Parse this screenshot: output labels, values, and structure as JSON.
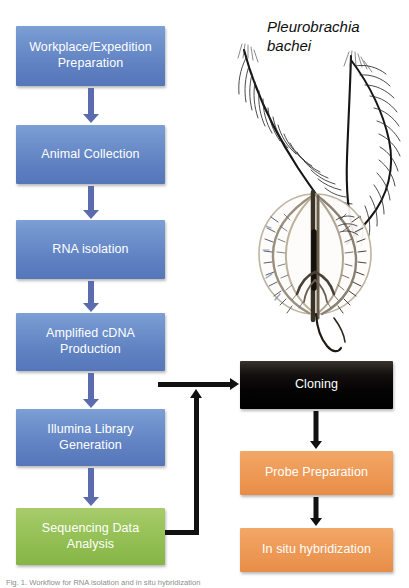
{
  "figure": {
    "species_label": "Pleurobrachia\nbachei",
    "caption": "Fig. 1. Workflow for RNA isolation and in situ hybridization",
    "organism_icon": "ctenophore-illustration"
  },
  "colors": {
    "blue_box": "#6a8bc7",
    "green_box": "#92bd53",
    "black_box": "#0a0807",
    "orange_box": "#ec9754",
    "blue_arrow": "#5a6cad",
    "black_arrow": "#111111",
    "background": "#ffffff",
    "box_text": "#ffffff"
  },
  "left_column": {
    "steps": [
      {
        "id": "workplace-expedition-preparation",
        "label": "Workplace/Expedition\nPreparation",
        "color": "blue"
      },
      {
        "id": "animal-collection",
        "label": "Animal Collection",
        "color": "blue"
      },
      {
        "id": "rna-isolation",
        "label": "RNA isolation",
        "color": "blue"
      },
      {
        "id": "amplified-cdna-production",
        "label": "Amplified cDNA\nProduction",
        "color": "blue"
      },
      {
        "id": "illumina-library-generation",
        "label": "Illumina Library\nGeneration",
        "color": "blue"
      },
      {
        "id": "sequencing-data-analysis",
        "label": "Sequencing Data\nAnalysis",
        "color": "green"
      }
    ]
  },
  "right_column": {
    "steps": [
      {
        "id": "cloning",
        "label": "Cloning",
        "color": "black"
      },
      {
        "id": "probe-preparation",
        "label": "Probe Preparation",
        "color": "orange"
      },
      {
        "id": "in-situ-hybridization",
        "label": "In situ hybridization",
        "color": "orange"
      }
    ]
  },
  "connectors": {
    "left_flow_arrows": 5,
    "right_flow_arrows": 2,
    "feedback_arrow": "sequencing-data-analysis-to-cloning"
  }
}
